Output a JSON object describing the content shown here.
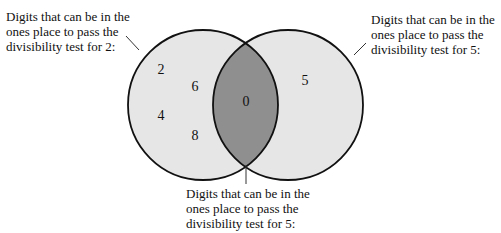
{
  "diagram": {
    "type": "venn",
    "colors": {
      "circle_fill": "#e6e6e6",
      "intersection_fill": "#8f8f8f",
      "stroke": "#111111",
      "background": "#ffffff"
    },
    "left_set": {
      "label": "Digits that can be in the\nones place to pass the\ndivisibility test for 2:",
      "elements": [
        "2",
        "6",
        "4",
        "8"
      ]
    },
    "right_set": {
      "label": "Digits that can be in the\nones place to pass the\ndivisibility test for 5:",
      "elements": [
        "5"
      ]
    },
    "intersection": {
      "label": "Digits that can be in the\nones place to pass the\ndivisibility test for 5:",
      "elements": [
        "0"
      ]
    }
  }
}
